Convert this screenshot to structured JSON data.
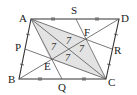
{
  "figure": {
    "type": "parallelogram-geometry",
    "shade_color": "#e3e3e3",
    "line_color": "#333333",
    "aux_line_color": "#555555",
    "points": {
      "A": {
        "label": "A",
        "x": 31,
        "y": 19
      },
      "D": {
        "label": "D",
        "x": 119,
        "y": 19
      },
      "B": {
        "label": "B",
        "x": 19,
        "y": 79
      },
      "C": {
        "label": "C",
        "x": 106,
        "y": 79
      },
      "S": {
        "label": "S",
        "x": 76,
        "y": 19
      },
      "P": {
        "label": "P",
        "x": 25,
        "y": 49
      },
      "Q": {
        "label": "Q",
        "x": 62,
        "y": 79
      },
      "R": {
        "label": "R",
        "x": 112,
        "y": 49
      },
      "E": {
        "label": "E",
        "x": 50,
        "y": 59
      },
      "F": {
        "label": "F",
        "x": 85,
        "y": 39
      }
    },
    "region_numbers": [
      "7",
      "7",
      "7",
      "7"
    ],
    "shaded_region": "AFCE"
  }
}
